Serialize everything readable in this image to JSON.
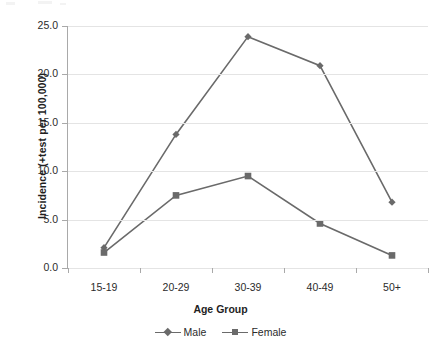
{
  "chart_data": {
    "type": "line",
    "title": "",
    "xlabel": "Age Group",
    "ylabel": "Incidence (+test  per 100,000)",
    "categories": [
      "15-19",
      "20-29",
      "30-39",
      "40-49",
      "50+"
    ],
    "ylim": [
      0.0,
      25.0
    ],
    "ytick_labels": [
      "25.0",
      "20.0",
      "15.0",
      "10.0",
      "5.0",
      "0.0"
    ],
    "ytick_values": [
      25.0,
      20.0,
      15.0,
      10.0,
      5.0,
      0.0
    ],
    "grid": "horizontal",
    "legend_position": "bottom-center",
    "series": [
      {
        "name": "Male",
        "marker": "diamond",
        "color": "#6a6a6a",
        "values": [
          2.1,
          13.8,
          23.9,
          20.9,
          6.8
        ]
      },
      {
        "name": "Female",
        "marker": "square",
        "color": "#6a6a6a",
        "values": [
          1.6,
          7.5,
          9.5,
          4.6,
          1.3
        ]
      }
    ]
  },
  "colors": {
    "series": "#6a6a6a",
    "gridline": "#e4e4e4",
    "axis": "#a9a9a9",
    "text": "#2b2b2b",
    "background": "#ffffff"
  }
}
